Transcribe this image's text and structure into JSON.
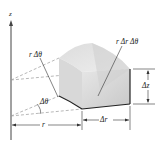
{
  "diagram": {
    "axis_label": "z",
    "labels": {
      "arc_length": "r Δθ",
      "top_area": "r Δr Δθ",
      "height": "Δz",
      "angle": "Δθ",
      "radius": "r",
      "radial_width": "Δr"
    },
    "colors": {
      "line": "#333333",
      "dashed": "#888888",
      "face_light": "#e4e4e4",
      "face_mid": "#d2d2d2",
      "face_dark": "#c4c4c4"
    }
  }
}
